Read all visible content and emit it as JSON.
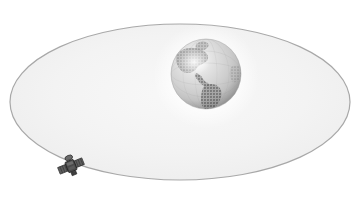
{
  "illustration": {
    "title": "Satellite orbiting Earth",
    "style": "grayscale halftone clip art",
    "background_color": "#ffffff",
    "canvas": {
      "width": 359,
      "height": 199
    }
  },
  "orbit": {
    "name": "orbital path ellipse",
    "center_x": 180,
    "center_y": 102,
    "radius_x": 170,
    "radius_y": 78,
    "stroke_color": "#a8a8a8",
    "stroke_width": 1.2,
    "fill_color": "#f3f3f3",
    "fill_opacity": 1
  },
  "earth": {
    "name": "Earth globe",
    "center_x": 206,
    "center_y": 74,
    "radius": 35,
    "ocean_color": "#cfcfcf",
    "land_color": "#9a9a9a",
    "highlight_color": "#fbfbfb",
    "shadow_color": "#8d8d8d",
    "halo_color": "#ffffff",
    "visible_continents": [
      "North America",
      "South America",
      "Central America",
      "Greenland"
    ]
  },
  "satellite": {
    "name": "satellite",
    "center_x": 71,
    "center_y": 166,
    "width": 26,
    "height": 22,
    "body_color": "#4a4a4a",
    "panel_color": "#6b6b6b",
    "accent_color": "#2e2e2e",
    "position_on_orbit": "lower-left"
  },
  "palette": {
    "white": "#ffffff",
    "light_gray": "#f3f3f3",
    "mid_gray": "#a8a8a8",
    "dark_gray": "#4a4a4a"
  }
}
